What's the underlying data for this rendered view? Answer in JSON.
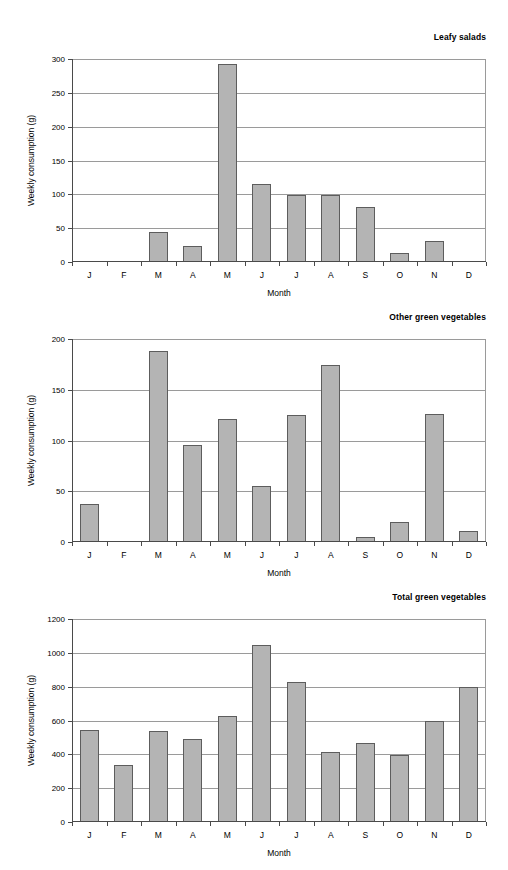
{
  "page": {
    "background_color": "#ffffff",
    "bar_fill_color": "#b4b4b4",
    "bar_border_color": "#5d5d5d",
    "gridline_color": "#9a9a9a",
    "axis_color": "#4a4a4a"
  },
  "chart_data": [
    {
      "type": "bar",
      "title": "Leafy salads",
      "xlabel": "Month",
      "ylabel": "Weekly consumption (g)",
      "categories": [
        "J",
        "F",
        "M",
        "A",
        "M",
        "J",
        "J",
        "A",
        "S",
        "O",
        "N",
        "D"
      ],
      "values": [
        0,
        0,
        44,
        24,
        293,
        116,
        99,
        99,
        82,
        13,
        31,
        0
      ],
      "ylim": [
        0,
        300
      ],
      "yticks": [
        0,
        50,
        100,
        150,
        200,
        250,
        300
      ],
      "ytick_labels": [
        "0",
        "50",
        "100",
        "150",
        "200",
        "250",
        "300"
      ],
      "grid": true,
      "legend": "none"
    },
    {
      "type": "bar",
      "title": "Other green vegetables",
      "xlabel": "Month",
      "ylabel": "Weekly consumption (g)",
      "categories": [
        "J",
        "F",
        "M",
        "A",
        "M",
        "J",
        "J",
        "A",
        "S",
        "O",
        "N",
        "D"
      ],
      "values": [
        37,
        0,
        188,
        96,
        121,
        55,
        125,
        174,
        5,
        20,
        126,
        11
      ],
      "ylim": [
        0,
        200
      ],
      "yticks": [
        0,
        50,
        100,
        150,
        200
      ],
      "ytick_labels": [
        "0",
        "50",
        "100",
        "150",
        "200"
      ],
      "grid": true,
      "legend": "none"
    },
    {
      "type": "bar",
      "title": "Total green vegetables",
      "xlabel": "Month",
      "ylabel": "Weekly consumption (g)",
      "categories": [
        "J",
        "F",
        "M",
        "A",
        "M",
        "J",
        "J",
        "A",
        "S",
        "O",
        "N",
        "D"
      ],
      "values": [
        545,
        338,
        538,
        492,
        625,
        1045,
        825,
        415,
        465,
        398,
        595,
        798
      ],
      "ylim": [
        0,
        1200
      ],
      "yticks": [
        0,
        200,
        400,
        600,
        800,
        1000,
        1200
      ],
      "ytick_labels": [
        "0",
        "200",
        "400",
        "600",
        "800",
        "1000",
        "1200"
      ],
      "grid": true,
      "legend": "none"
    }
  ]
}
